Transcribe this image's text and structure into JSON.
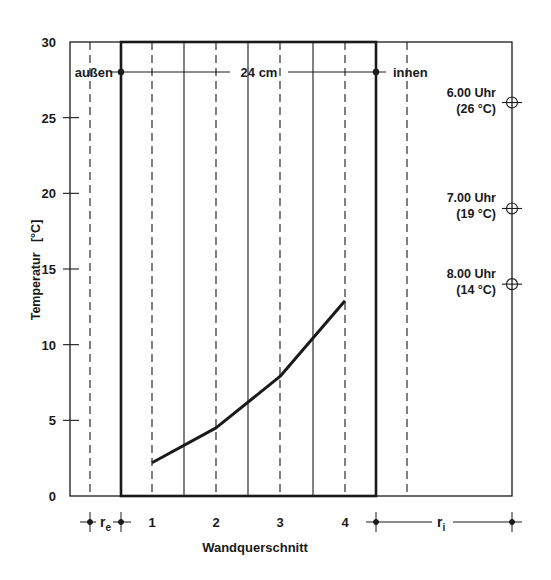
{
  "chart_data": {
    "type": "line",
    "title": "",
    "xlabel": "Wandquerschnitt",
    "ylabel": "Temperatur   [°C]",
    "ylim": [
      0,
      30
    ],
    "yticks": [
      0,
      5,
      10,
      15,
      20,
      25,
      30
    ],
    "xtick_labels": [
      "1",
      "2",
      "3",
      "4"
    ],
    "grid": false,
    "series": [
      {
        "name": "Temperaturverlauf",
        "x": [
          "1",
          "2",
          "3",
          "4"
        ],
        "values": [
          2.2,
          4.5,
          7.9,
          12.9
        ]
      }
    ],
    "annotations": {
      "outside_label": "außen",
      "inside_label": "innen",
      "wall_thickness": "24 cm",
      "r_e": "r",
      "r_e_sub": "e",
      "r_i": "r",
      "r_i_sub": "i",
      "time_markers": [
        {
          "time": "6.00 Uhr",
          "temp_label": "(26 °C)",
          "value": 26
        },
        {
          "time": "7.00 Uhr",
          "temp_label": "(19 °C)",
          "value": 19
        },
        {
          "time": "8.00 Uhr",
          "temp_label": "(14 °C)",
          "value": 14
        }
      ]
    }
  },
  "colors": {
    "ink": "#1a1a1a",
    "background": "#ffffff"
  }
}
